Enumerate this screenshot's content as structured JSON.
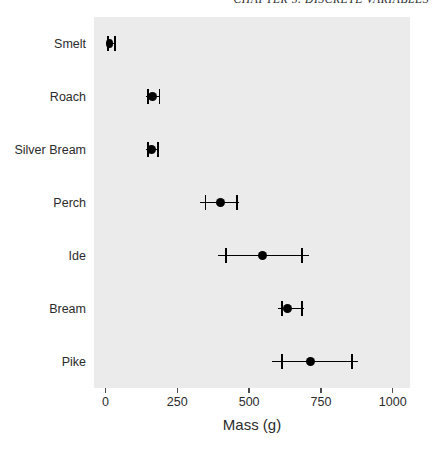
{
  "page": {
    "running_header": "CHAPTER 5. DISCRETE VARIABLES"
  },
  "chart_data": {
    "type": "scatter",
    "subtype": "dot-and-whisker error bar plot",
    "title": "",
    "xlabel": "Mass (g)",
    "ylabel": "",
    "xlim": [
      -40,
      1060
    ],
    "xticks": [
      0,
      250,
      500,
      750,
      1000
    ],
    "xticklabels": [
      "0",
      "250",
      "500",
      "750",
      "1000"
    ],
    "grid": false,
    "legend": false,
    "panel_background": "#ebebeb",
    "marker_color": "#000000",
    "categories": [
      "Smelt",
      "Roach",
      "Silver Bream",
      "Perch",
      "Ide",
      "Bream",
      "Pike"
    ],
    "values": [
      15,
      165,
      160,
      400,
      545,
      635,
      715
    ],
    "error_low": [
      5,
      145,
      145,
      345,
      415,
      610,
      610
    ],
    "error_high": [
      30,
      185,
      180,
      455,
      680,
      680,
      855
    ],
    "whisker_min": [
      5,
      140,
      140,
      330,
      390,
      600,
      580
    ],
    "whisker_max": [
      32,
      190,
      185,
      465,
      710,
      690,
      880
    ],
    "points": [
      {
        "category": "Smelt",
        "mean": 15,
        "low": 5,
        "high": 30,
        "line_min": 5,
        "line_max": 32
      },
      {
        "category": "Roach",
        "mean": 165,
        "low": 145,
        "high": 185,
        "line_min": 140,
        "line_max": 190
      },
      {
        "category": "Silver Bream",
        "mean": 160,
        "low": 145,
        "high": 180,
        "line_min": 140,
        "line_max": 185
      },
      {
        "category": "Perch",
        "mean": 400,
        "low": 345,
        "high": 455,
        "line_min": 330,
        "line_max": 465
      },
      {
        "category": "Ide",
        "mean": 545,
        "low": 415,
        "high": 680,
        "line_min": 390,
        "line_max": 710
      },
      {
        "category": "Bream",
        "mean": 635,
        "low": 610,
        "high": 680,
        "line_min": 600,
        "line_max": 690
      },
      {
        "category": "Pike",
        "mean": 715,
        "low": 610,
        "high": 855,
        "line_min": 580,
        "line_max": 880
      }
    ]
  }
}
